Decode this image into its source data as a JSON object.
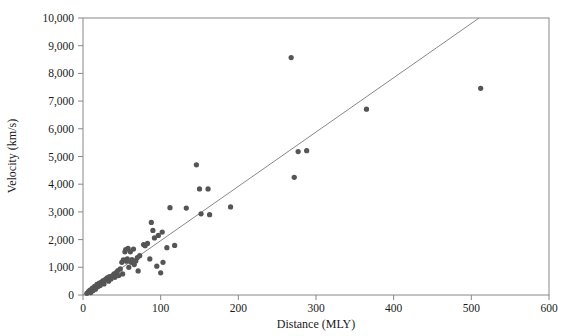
{
  "chart_data": {
    "type": "scatter",
    "title": "",
    "xlabel": "Distance (MLY)",
    "ylabel": "Velocity (km/s)",
    "xlim": [
      0,
      600
    ],
    "ylim": [
      0,
      10000
    ],
    "xticks": [
      0,
      100,
      200,
      300,
      400,
      500,
      600
    ],
    "xtick_labels": [
      "0",
      "100",
      "200",
      "300",
      "400",
      "500",
      "600"
    ],
    "yticks": [
      0,
      1000,
      2000,
      3000,
      4000,
      5000,
      6000,
      7000,
      8000,
      9000,
      10000
    ],
    "ytick_labels": [
      "0",
      "1,000",
      "2,000",
      "3,000",
      "4,000",
      "5,000",
      "6,000",
      "7,000",
      "8,000",
      "9,000",
      "10,000"
    ],
    "grid": false,
    "legend": null,
    "marker_color": "#555555",
    "marker_size": 4.2,
    "line_color": "#888888",
    "frame_color": "#888888",
    "series": [
      {
        "name": "Galaxies",
        "type": "scatter",
        "points": [
          [
            5,
            60
          ],
          [
            7,
            120
          ],
          [
            9,
            180
          ],
          [
            10,
            90
          ],
          [
            12,
            250
          ],
          [
            13,
            160
          ],
          [
            15,
            310
          ],
          [
            16,
            210
          ],
          [
            18,
            380
          ],
          [
            19,
            300
          ],
          [
            21,
            430
          ],
          [
            22,
            340
          ],
          [
            24,
            470
          ],
          [
            26,
            520
          ],
          [
            27,
            400
          ],
          [
            29,
            560
          ],
          [
            31,
            620
          ],
          [
            33,
            500
          ],
          [
            34,
            660
          ],
          [
            36,
            580
          ],
          [
            38,
            700
          ],
          [
            40,
            760
          ],
          [
            41,
            640
          ],
          [
            43,
            820
          ],
          [
            45,
            880
          ],
          [
            46,
            700
          ],
          [
            48,
            940
          ],
          [
            50,
            1180
          ],
          [
            51,
            760
          ],
          [
            52,
            1270
          ],
          [
            54,
            1560
          ],
          [
            55,
            1640
          ],
          [
            56,
            1220
          ],
          [
            57,
            1300
          ],
          [
            58,
            1680
          ],
          [
            59,
            1000
          ],
          [
            61,
            1560
          ],
          [
            62,
            1180
          ],
          [
            63,
            1280
          ],
          [
            65,
            1660
          ],
          [
            66,
            1100
          ],
          [
            68,
            1230
          ],
          [
            70,
            1350
          ],
          [
            71,
            870
          ],
          [
            73,
            1420
          ],
          [
            78,
            1820
          ],
          [
            80,
            1780
          ],
          [
            83,
            1860
          ],
          [
            86,
            1300
          ],
          [
            88,
            2620
          ],
          [
            90,
            2330
          ],
          [
            92,
            2060
          ],
          [
            95,
            1040
          ],
          [
            97,
            2150
          ],
          [
            100,
            800
          ],
          [
            102,
            2270
          ],
          [
            103,
            1180
          ],
          [
            108,
            1710
          ],
          [
            112,
            3150
          ],
          [
            118,
            1790
          ],
          [
            133,
            3140
          ],
          [
            146,
            4700
          ],
          [
            150,
            3830
          ],
          [
            152,
            2930
          ],
          [
            161,
            3830
          ],
          [
            163,
            2900
          ],
          [
            190,
            3180
          ],
          [
            268,
            8570
          ],
          [
            272,
            4250
          ],
          [
            277,
            5180
          ],
          [
            288,
            5210
          ],
          [
            365,
            6710
          ],
          [
            512,
            7460
          ]
        ]
      },
      {
        "name": "Hubble trend line",
        "type": "line",
        "points": [
          [
            0,
            0
          ],
          [
            510,
            10000
          ]
        ]
      }
    ]
  }
}
